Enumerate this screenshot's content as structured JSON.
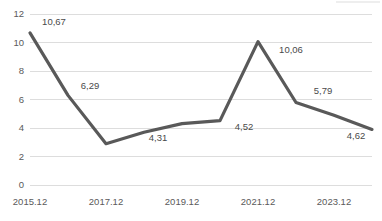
{
  "chart_data": {
    "type": "line",
    "title": "",
    "subtitle": "",
    "xlabel": "",
    "ylabel": "",
    "ylim": [
      0,
      12
    ],
    "y_ticks": [
      "0",
      "2",
      "4",
      "6",
      "8",
      "10",
      "12"
    ],
    "y_tick_values": [
      0,
      2,
      4,
      6,
      8,
      10,
      12
    ],
    "grid": true,
    "legend": false,
    "legend_position": "none",
    "decimal_separator": ",",
    "x_tick_labels": [
      "2015.12",
      "2017.12",
      "2019.12",
      "2021.12",
      "2023.12"
    ],
    "x_tick_indices": [
      0,
      2,
      4,
      6,
      8
    ],
    "x": [
      "2015.12",
      "2016.12",
      "2017.12",
      "2018.12",
      "2019.12",
      "2020.12",
      "2021.12",
      "2022.12",
      "2023.12",
      "2024.12"
    ],
    "series": [
      {
        "name": "series-1",
        "color": "#595959",
        "values": [
          10.67,
          6.29,
          2.9,
          3.7,
          4.31,
          4.52,
          10.06,
          5.79,
          4.9,
          3.9
        ]
      }
    ],
    "point_labels": [
      {
        "index": 0,
        "text": "10,67",
        "value": 10.67,
        "dx": 24,
        "dy": -8
      },
      {
        "index": 1,
        "text": "6,29",
        "value": 6.29,
        "dx": 22,
        "dy": -6
      },
      {
        "index": 3,
        "text": "4,31",
        "value": 4.31,
        "dx": 14,
        "dy": 17
      },
      {
        "index": 5,
        "text": "4,52",
        "value": 4.52,
        "dx": 24,
        "dy": 9
      },
      {
        "index": 6,
        "text": "10,06",
        "value": 10.06,
        "dx": 33,
        "dy": 11
      },
      {
        "index": 7,
        "text": "5,79",
        "value": 5.79,
        "dx": 27,
        "dy": -8
      },
      {
        "index": 9,
        "text": "4,62",
        "value": 4.62,
        "dx": -16,
        "dy": 20
      }
    ],
    "colors": {
      "line": "#595959",
      "gridline": "#d9d9d9",
      "axis_text": "#5a5a5a",
      "label_text": "#4a4a4a",
      "background": "#ffffff"
    },
    "layout": {
      "plot_left": 30,
      "plot_right": 372,
      "plot_top": 14,
      "plot_bottom": 185,
      "line_width": 3.2,
      "x_axis_label_y": 205
    }
  }
}
